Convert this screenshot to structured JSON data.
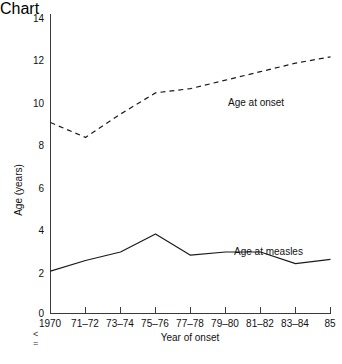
{
  "chart_data": {
    "type": "line",
    "title": "",
    "xlabel": "Year of onset",
    "ylabel": "Age (years)",
    "categories": [
      "1970",
      "71–72",
      "73–74",
      "75–76",
      "77–78",
      "79–80",
      "81–82",
      "83–84",
      "85"
    ],
    "xtick_labels": [
      "1970",
      "71–72",
      "73–74",
      "75–76",
      "77–78",
      "79–80",
      "81–82",
      "83–84",
      "85"
    ],
    "ytick_labels": [
      "0",
      "2",
      "4",
      "6",
      "8",
      "10",
      "12",
      "14"
    ],
    "yticks": [
      0,
      2,
      4,
      6,
      8,
      10,
      12,
      14
    ],
    "ylim": [
      0,
      14
    ],
    "grid": false,
    "legend_position": "inline-annotation",
    "series": [
      {
        "name": "Age at onset",
        "style": "dashed",
        "color": "#1a1a1a",
        "values": [
          9.0,
          8.3,
          9.4,
          10.4,
          10.6,
          11.0,
          11.4,
          11.8,
          12.1
        ]
      },
      {
        "name": "Age at measles",
        "style": "solid",
        "color": "#1a1a1a",
        "values": [
          2.0,
          2.5,
          2.9,
          3.75,
          2.75,
          2.9,
          2.9,
          2.35,
          2.55
        ]
      }
    ],
    "annotations": [
      {
        "text": "Age at onset",
        "x_px": 228,
        "y_px": 103
      },
      {
        "text": "Age at measles",
        "x_px": 234,
        "y_px": 252
      }
    ]
  },
  "margin_glyphs": [
    "<",
    "="
  ],
  "caption_faint": ""
}
